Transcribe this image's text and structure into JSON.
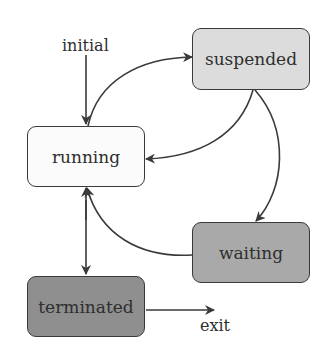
{
  "colors": {
    "running": "#fbfbfb",
    "suspended": "#dcdcdc",
    "waiting": "#a9a9a9",
    "terminated": "#8f8f8f",
    "edge": "#3a3a3a"
  },
  "nodes": {
    "running": {
      "label": "running"
    },
    "suspended": {
      "label": "suspended"
    },
    "waiting": {
      "label": "waiting"
    },
    "terminated": {
      "label": "terminated"
    }
  },
  "labels": {
    "initial": "initial",
    "exit": "exit"
  },
  "edges": [
    {
      "from": "initial",
      "to": "running"
    },
    {
      "from": "running",
      "to": "suspended"
    },
    {
      "from": "suspended",
      "to": "running"
    },
    {
      "from": "suspended",
      "to": "waiting"
    },
    {
      "from": "waiting",
      "to": "running"
    },
    {
      "from": "running",
      "to": "terminated"
    },
    {
      "from": "terminated",
      "to": "running"
    },
    {
      "from": "terminated",
      "to": "exit"
    }
  ]
}
